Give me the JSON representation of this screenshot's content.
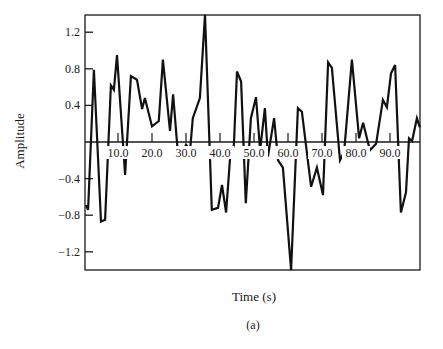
{
  "chart_data": {
    "type": "line",
    "title": "",
    "xlabel": "Time (s)",
    "ylabel": "Amplitude",
    "caption": "(a)",
    "xlim": [
      0,
      100
    ],
    "ylim": [
      -1.4,
      1.4
    ],
    "grid": false,
    "legend": null,
    "x_ticks": [
      10,
      20,
      30,
      40,
      50,
      60,
      70,
      80,
      90
    ],
    "x_tick_labels": [
      "10.0",
      "20.0",
      "30.0",
      "40.0",
      "50.0",
      "60.0",
      "70.0",
      "80.0",
      "90.0"
    ],
    "x_ticks_on_zero_line": true,
    "y_ticks": [
      1.2,
      0.8,
      0.4,
      -0.4,
      -0.8,
      -1.2
    ],
    "y_tick_labels": [
      "1.2",
      "0.8",
      "0.4",
      "−0.4",
      "−0.8",
      "−1.2"
    ],
    "series": [
      {
        "name": "signal",
        "color": "#111111",
        "x": [
          0.6,
          1.2,
          2.9,
          5.0,
          6.2,
          7.9,
          8.8,
          9.7,
          12.1,
          13.8,
          15.6,
          17.1,
          17.9,
          20.0,
          22.0,
          23.2,
          25.3,
          26.2,
          27.6,
          28.8,
          30.0,
          31.2,
          32.0,
          34.1,
          35.6,
          37.6,
          39.4,
          40.6,
          41.8,
          42.9,
          44.1,
          45.0,
          46.2,
          47.6,
          49.1,
          50.6,
          51.8,
          53.2,
          54.1,
          55.9,
          57.1,
          58.5,
          60.9,
          62.9,
          64.1,
          66.8,
          68.5,
          70.3,
          71.8,
          72.9,
          75.3,
          76.5,
          78.8,
          80.9,
          82.1,
          84.1,
          85.9,
          87.9,
          89.1,
          90.3,
          91.5,
          93.2,
          94.7,
          95.6,
          96.5,
          97.9,
          98.8
        ],
        "y": [
          -0.69,
          -0.74,
          0.79,
          -0.87,
          -0.85,
          0.62,
          0.57,
          0.95,
          -0.36,
          0.72,
          0.68,
          0.36,
          0.48,
          0.17,
          0.23,
          0.9,
          0.12,
          0.52,
          -0.11,
          -0.14,
          -0.03,
          -0.09,
          0.26,
          0.48,
          1.39,
          -0.74,
          -0.72,
          -0.47,
          -0.77,
          -0.2,
          -0.03,
          0.77,
          0.66,
          -0.67,
          0.26,
          0.49,
          -0.09,
          0.37,
          -0.16,
          0.26,
          -0.2,
          -0.28,
          -1.4,
          0.37,
          0.33,
          -0.49,
          -0.28,
          -0.58,
          0.87,
          0.81,
          -0.2,
          -0.11,
          0.9,
          0.04,
          0.21,
          -0.09,
          -0.02,
          0.46,
          0.38,
          0.75,
          0.84,
          -0.77,
          -0.55,
          0.04,
          0.01,
          0.26,
          0.16
        ]
      }
    ]
  },
  "layout": {
    "plot": {
      "left": 85,
      "right": 420,
      "top": 15,
      "bottom": 270
    },
    "x0_px": 84,
    "px_per_x": 3.4,
    "y0_px": 142,
    "px_per_y": 91.5
  }
}
